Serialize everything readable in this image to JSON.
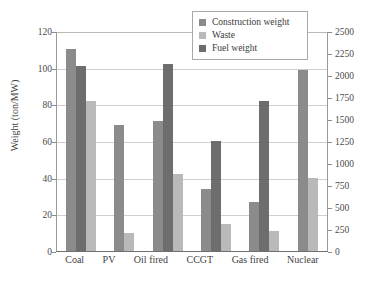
{
  "chart_data": {
    "type": "bar",
    "title": "",
    "xlabel": "",
    "ylabel": "Weight (ton/MW)",
    "y2label": "Fuel weight (ton/MW/year)",
    "ylim": [
      0,
      120
    ],
    "y2lim": [
      0,
      2500
    ],
    "grid": true,
    "legend_position": "top-right",
    "categories": [
      "Coal",
      "PV",
      "Oil fired",
      "CCGT",
      "Gas fired",
      "Nuclear"
    ],
    "yticks": [
      "0",
      "20",
      "40",
      "60",
      "80",
      "100",
      "120"
    ],
    "y2ticks": [
      "0",
      "250",
      "500",
      "750",
      "1000",
      "1250",
      "1500",
      "1750",
      "2000",
      "2250",
      "2500"
    ],
    "series": [
      {
        "name": "Construction weight",
        "axis": "left",
        "color": "#8b8b8b",
        "values": [
          110,
          69,
          71,
          34,
          27,
          99
        ]
      },
      {
        "name": "Waste",
        "axis": "left",
        "color": "#b9b9b9",
        "values": [
          82,
          10,
          42,
          15,
          11,
          40
        ]
      },
      {
        "name": "Fuel weight",
        "axis": "right",
        "color": "#6d6d6d",
        "values": [
          2100,
          null,
          2130,
          1260,
          1700,
          null
        ],
        "values_left_scale": [
          101,
          null,
          102,
          60,
          82,
          null
        ]
      }
    ]
  },
  "legend": {
    "items": [
      {
        "label": "Construction weight",
        "color": "#8b8b8b"
      },
      {
        "label": "Waste",
        "color": "#b9b9b9"
      },
      {
        "label": "Fuel weight",
        "color": "#6d6d6d"
      }
    ]
  },
  "axes": {
    "left_title": "Weight (ton/MW)",
    "right_title": "Fuel weight (ton/MW/year)"
  }
}
